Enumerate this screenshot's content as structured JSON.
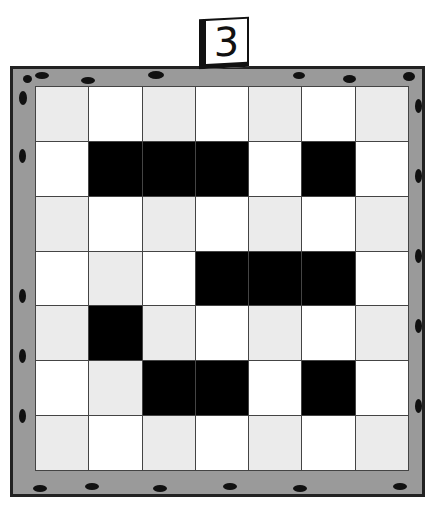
{
  "puzzle": {
    "number": "3",
    "rows": 7,
    "cols": 7,
    "colors": {
      "white": "#ffffff",
      "light": "#ebebeb",
      "black": "#000000",
      "frame": "#9a9a9a"
    },
    "black_cells": [
      [
        1,
        1
      ],
      [
        1,
        2
      ],
      [
        1,
        3
      ],
      [
        1,
        5
      ],
      [
        3,
        3
      ],
      [
        3,
        4
      ],
      [
        3,
        5
      ],
      [
        4,
        1
      ],
      [
        5,
        2
      ],
      [
        5,
        3
      ],
      [
        5,
        5
      ]
    ]
  }
}
